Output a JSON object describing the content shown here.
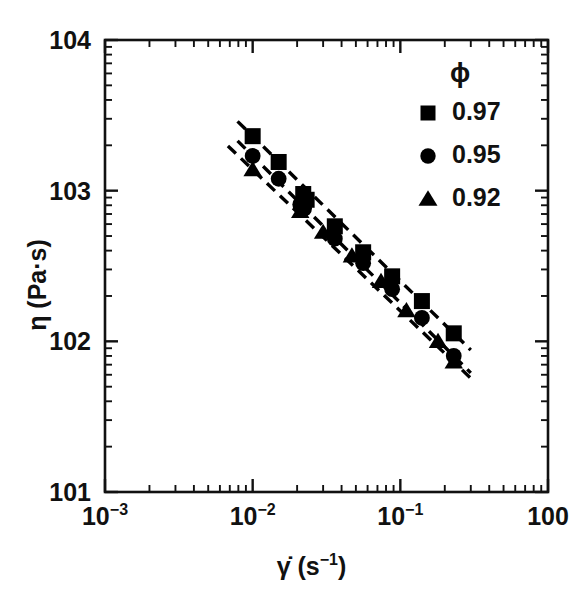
{
  "chart_data": {
    "type": "scatter",
    "title": "",
    "xlabel": "γ̇ (s⁻¹)",
    "ylabel": "η (Pa·s)",
    "xscale": "log",
    "yscale": "log",
    "xlim": [
      0.001,
      1.0
    ],
    "ylim": [
      10,
      10000
    ],
    "grid": false,
    "legend_position": "top-right",
    "legend_title": "ϕ",
    "x_tick_labels": [
      "10⁻³",
      "10⁻²",
      "10⁻¹",
      "10⁰"
    ],
    "x_tick_values": [
      0.001,
      0.01,
      0.1,
      1
    ],
    "y_tick_labels": [
      "10¹",
      "10²",
      "10³",
      "10⁴"
    ],
    "y_tick_values": [
      10,
      100,
      1000,
      10000
    ],
    "series": [
      {
        "name": "0.97",
        "marker": "square",
        "color": "#000000",
        "fit_line": {
          "style": "dashed",
          "x_start": 0.0079,
          "x_end": 0.3
        },
        "x": [
          0.01,
          0.015,
          0.022,
          0.0232,
          0.036,
          0.056,
          0.088,
          0.14,
          0.23
        ],
        "y": [
          2300,
          1550,
          950,
          870,
          580,
          390,
          270,
          185,
          113
        ]
      },
      {
        "name": "0.95",
        "marker": "circle",
        "color": "#000000",
        "fit_line": {
          "style": "dashed",
          "x_start": 0.0079,
          "x_end": 0.3
        },
        "x": [
          0.01,
          0.015,
          0.021,
          0.0223,
          0.036,
          0.056,
          0.088,
          0.14,
          0.23
        ],
        "y": [
          1700,
          1200,
          810,
          760,
          480,
          330,
          222,
          143,
          80
        ]
      },
      {
        "name": "0.92",
        "marker": "triangle",
        "color": "#000000",
        "fit_line": {
          "style": "dashed",
          "x_start": 0.0068,
          "x_end": 0.3
        },
        "x": [
          0.01,
          0.021,
          0.03,
          0.047,
          0.074,
          0.11,
          0.18,
          0.23
        ],
        "y": [
          1380,
          730,
          530,
          370,
          250,
          160,
          100,
          73
        ]
      }
    ]
  },
  "axes": {
    "x_title_base": "γ̇ (s",
    "x_title_exp": "−1",
    "x_title_tail": ")",
    "y_title": "η (Pa·s)"
  },
  "legend": {
    "title": "ϕ",
    "entries": [
      {
        "label": "0.97",
        "marker": "square"
      },
      {
        "label": "0.95",
        "marker": "circle"
      },
      {
        "label": "0.92",
        "marker": "triangle"
      }
    ]
  }
}
